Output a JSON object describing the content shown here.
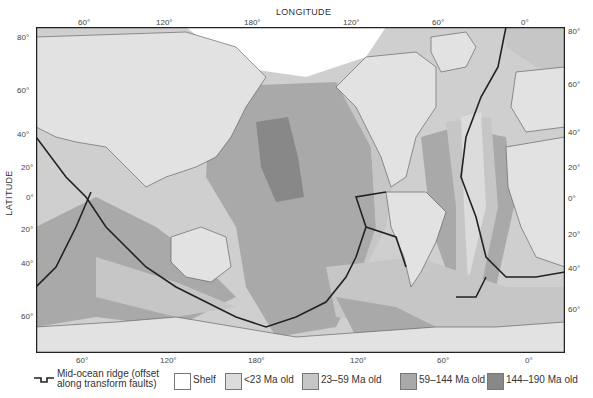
{
  "axes": {
    "top_label": "LONGITUDE",
    "left_label": "LATITUDE",
    "top_ticks": [
      "60°",
      "120°",
      "180°",
      "120°",
      "60°",
      "0°"
    ],
    "bottom_ticks": [
      "60°",
      "120°",
      "180°",
      "120°",
      "60°",
      "0°"
    ],
    "left_ticks": [
      "80°",
      "60°",
      "40°",
      "20°",
      "0°",
      "20°",
      "40°",
      "60°"
    ],
    "right_ticks": [
      "80°",
      "60°",
      "40°",
      "20°",
      "0°",
      "20°",
      "40°",
      "60°"
    ]
  },
  "legend": {
    "ridge_line1": "Mid-ocean ridge (offset",
    "ridge_line2": "along transform faults)",
    "items": [
      {
        "label": "Shelf",
        "color": "#ffffff"
      },
      {
        "label": "<23 Ma old",
        "color": "#dcdcdc"
      },
      {
        "label": "23–59 Ma old",
        "color": "#c6c6c6"
      },
      {
        "label": "59–144 Ma old",
        "color": "#a9a9a9"
      },
      {
        "label": "144–190 Ma old",
        "color": "#888888"
      }
    ]
  },
  "colors": {
    "land": "#e2e2e2",
    "shelf": "#ffffff",
    "age_lt23": "#dcdcdc",
    "age_23_59": "#c6c6c6",
    "age_59_144": "#a9a9a9",
    "age_144_190": "#888888",
    "ridge": "#222222",
    "frame": "#222222"
  }
}
